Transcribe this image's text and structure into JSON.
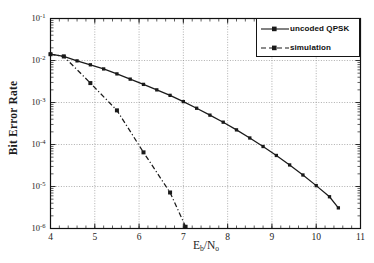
{
  "chart_data": {
    "type": "line",
    "title": "",
    "xlabel": "Eb/No",
    "xlabel_main": "E",
    "xlabel_sub1": "b",
    "xlabel_div": "/N",
    "xlabel_sub2": "o",
    "ylabel": "Bit Error Rate",
    "xlim": [
      4,
      11
    ],
    "ylim": [
      1e-06,
      0.1
    ],
    "yscale": "log",
    "xscale": "linear",
    "grid": true,
    "legend_position": "top-right",
    "xticks": [
      4,
      5,
      6,
      7,
      8,
      9,
      10,
      11
    ],
    "xtick_labels": [
      "4",
      "5",
      "6",
      "7",
      "8",
      "9",
      "10",
      "11"
    ],
    "yticks": [
      0.1,
      0.01,
      0.001,
      0.0001,
      1e-05,
      1e-06
    ],
    "ytick_labels": [
      "10-1",
      "10-2",
      "10-3",
      "10-4",
      "10-5",
      "10-6"
    ],
    "ytick_mantissa": "10",
    "ytick_exponents": [
      "-1",
      "-2",
      "-3",
      "-4",
      "-5",
      "-6"
    ],
    "series": [
      {
        "name": "uncoded QPSK",
        "linestyle": "solid",
        "marker": "square",
        "color": "#1a1a1a",
        "x": [
          4.0,
          4.3,
          4.6,
          4.9,
          5.2,
          5.5,
          5.8,
          6.1,
          6.4,
          6.7,
          7.0,
          7.3,
          7.6,
          7.9,
          8.2,
          8.5,
          8.8,
          9.1,
          9.4,
          9.7,
          10.0,
          10.3,
          10.5
        ],
        "y": [
          0.0141,
          0.0125,
          0.0098,
          0.0079,
          0.0063,
          0.0048,
          0.0036,
          0.0027,
          0.002,
          0.00148,
          0.00105,
          0.00073,
          0.0005,
          0.00034,
          0.000223,
          0.000143,
          8.96e-05,
          5.48e-05,
          3.26e-05,
          1.88e-05,
          1.05e-05,
          5.7e-06,
          3.1e-06
        ]
      },
      {
        "name": "simulation",
        "linestyle": "dashdot",
        "marker": "square",
        "color": "#1a1a1a",
        "x": [
          4.0,
          4.3,
          4.9,
          5.5,
          6.1,
          6.7,
          7.05
        ],
        "y": [
          0.0141,
          0.0125,
          0.0029,
          0.00065,
          6.5e-05,
          7.2e-06,
          1.1e-06
        ]
      }
    ],
    "legend": [
      {
        "label": "uncoded QPSK",
        "linestyle": "solid",
        "marker": "square"
      },
      {
        "label": "simulation",
        "linestyle": "dashdot",
        "marker": "square"
      }
    ]
  }
}
